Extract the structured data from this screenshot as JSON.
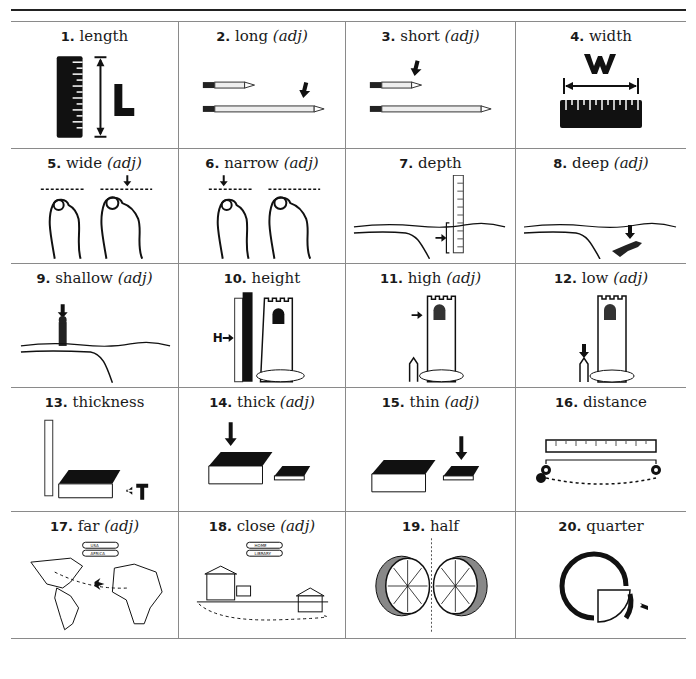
{
  "page": {
    "layout": "4x5 picture dictionary grid"
  },
  "items": [
    {
      "number": "1.",
      "word": "length",
      "pos": "",
      "illustration": "ruler-with-L-icon",
      "letter": "L"
    },
    {
      "number": "2.",
      "word": "long",
      "pos": "(adj)",
      "illustration": "long-pencil-icon"
    },
    {
      "number": "3.",
      "word": "short",
      "pos": "(adj)",
      "illustration": "short-pencil-icon"
    },
    {
      "number": "4.",
      "word": "width",
      "pos": "",
      "illustration": "ruler-with-W-icon",
      "letter": "W"
    },
    {
      "number": "5.",
      "word": "wide",
      "pos": "(adj)",
      "illustration": "wide-foot-icon"
    },
    {
      "number": "6.",
      "word": "narrow",
      "pos": "(adj)",
      "illustration": "narrow-foot-icon"
    },
    {
      "number": "7.",
      "word": "depth",
      "pos": "",
      "illustration": "water-depth-gauge-icon"
    },
    {
      "number": "8.",
      "word": "deep",
      "pos": "(adj)",
      "illustration": "diver-deep-water-icon"
    },
    {
      "number": "9.",
      "word": "shallow",
      "pos": "(adj)",
      "illustration": "person-shallow-water-icon"
    },
    {
      "number": "10.",
      "word": "height",
      "pos": "",
      "illustration": "tower-height-ruler-icon",
      "letter": "H"
    },
    {
      "number": "11.",
      "word": "high",
      "pos": "(adj)",
      "illustration": "tower-high-window-icon"
    },
    {
      "number": "12.",
      "word": "low",
      "pos": "(adj)",
      "illustration": "tower-low-person-icon"
    },
    {
      "number": "13.",
      "word": "thickness",
      "pos": "",
      "illustration": "book-thickness-ruler-icon",
      "letter": "T"
    },
    {
      "number": "14.",
      "word": "thick",
      "pos": "(adj)",
      "illustration": "thick-book-icon"
    },
    {
      "number": "15.",
      "word": "thin",
      "pos": "(adj)",
      "illustration": "thin-book-icon"
    },
    {
      "number": "16.",
      "word": "distance",
      "pos": "",
      "illustration": "ruler-distance-pins-icon"
    },
    {
      "number": "17.",
      "word": "far",
      "pos": "(adj)",
      "illustration": "map-usa-africa-icon",
      "labels": [
        "USA",
        "AFRICA"
      ]
    },
    {
      "number": "18.",
      "word": "close",
      "pos": "(adj)",
      "illustration": "home-library-icon",
      "labels": [
        "HOME",
        "LIBRARY"
      ]
    },
    {
      "number": "19.",
      "word": "half",
      "pos": "",
      "illustration": "orange-halves-icon"
    },
    {
      "number": "20.",
      "word": "quarter",
      "pos": "",
      "illustration": "circle-quarter-icon"
    }
  ]
}
